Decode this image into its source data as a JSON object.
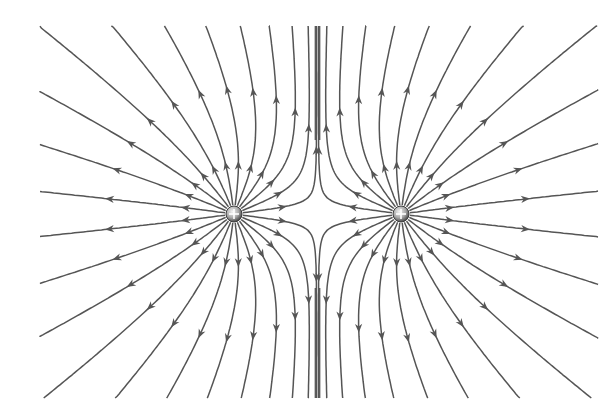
{
  "diagram": {
    "width": 615,
    "height": 419,
    "bounds": {
      "x_min": 40,
      "x_max": 598,
      "y_min": 26,
      "y_max": 398
    },
    "line_color": "#555555",
    "charge_fill": "#9a9a9a",
    "background": "#ffffff",
    "lines_per_charge": 24,
    "charges": [
      {
        "id": "charge-left",
        "x": 234,
        "y": 214,
        "q": 1,
        "sign": "+"
      },
      {
        "id": "charge-right",
        "x": 401,
        "y": 214,
        "q": 1,
        "sign": "+"
      }
    ],
    "arrow_direction": "outward",
    "midline_x": 317.5
  }
}
